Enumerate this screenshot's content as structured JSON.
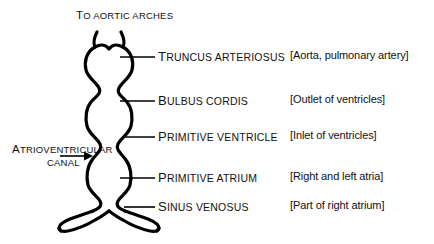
{
  "figure": {
    "title_caption": "To aortic arches",
    "background_color": "#ffffff",
    "ink_color": "#000000"
  },
  "top_caption": {
    "text": "To aortic arches"
  },
  "left_annotation": {
    "line1": "Atrioventricular",
    "line2": "canal",
    "arrow": "arrow-right"
  },
  "segments": [
    {
      "id": "truncus-arteriosus",
      "label": "Truncus arteriosus",
      "bracket": "[Aorta, pulmonary artery]",
      "leader_y": 57
    },
    {
      "id": "bulbus-cordis",
      "label": "Bulbus cordis",
      "bracket": "[Outlet of ventricles]",
      "leader_y": 101
    },
    {
      "id": "primitive-ventricle",
      "label": "Primitive ventricle",
      "bracket": "[Inlet of ventricles]",
      "leader_y": 137
    },
    {
      "id": "primitive-atrium",
      "label": "Primitive atrium",
      "bracket": "[Right and left atria]",
      "leader_y": 178
    },
    {
      "id": "sinus-venosus",
      "label": "Sinus venosus",
      "bracket": "[Part of right atrium]",
      "leader_y": 207
    }
  ]
}
